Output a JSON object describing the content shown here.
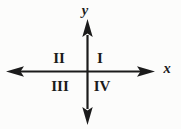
{
  "diagram": {
    "axes": {
      "x_label": "x",
      "y_label": "y"
    },
    "quadrants": {
      "q1": "I",
      "q2": "II",
      "q3": "III",
      "q4": "IV"
    },
    "colors": {
      "ink": "#1b1b1b",
      "background": "#fcfcfb"
    }
  }
}
